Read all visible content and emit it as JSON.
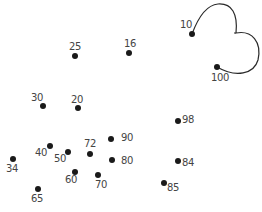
{
  "puzzle": {
    "type": "connect-the-dots",
    "drawn_path": {
      "from": "10",
      "to": "100",
      "description": "cloud-like outline drawn from dot 10 to dot 100",
      "stroke_color": "#2a2a2a"
    },
    "dots": [
      {
        "label": "10",
        "x": 192,
        "y": 34,
        "lx": 180,
        "ly": 20
      },
      {
        "label": "100",
        "x": 217,
        "y": 67,
        "lx": 211,
        "ly": 73
      },
      {
        "label": "25",
        "x": 75,
        "y": 56,
        "lx": 69,
        "ly": 42
      },
      {
        "label": "16",
        "x": 129,
        "y": 53,
        "lx": 124,
        "ly": 39
      },
      {
        "label": "30",
        "x": 43,
        "y": 106,
        "lx": 31,
        "ly": 93
      },
      {
        "label": "20",
        "x": 78,
        "y": 108,
        "lx": 71,
        "ly": 95
      },
      {
        "label": "98",
        "x": 178,
        "y": 121,
        "lx": 182,
        "ly": 115
      },
      {
        "label": "90",
        "x": 111,
        "y": 139,
        "lx": 121,
        "ly": 133
      },
      {
        "label": "72",
        "x": 90,
        "y": 154,
        "lx": 84,
        "ly": 139
      },
      {
        "label": "80",
        "x": 112,
        "y": 160,
        "lx": 121,
        "ly": 156
      },
      {
        "label": "40",
        "x": 50,
        "y": 146,
        "lx": 35,
        "ly": 148
      },
      {
        "label": "50",
        "x": 68,
        "y": 152,
        "lx": 54,
        "ly": 154
      },
      {
        "label": "34",
        "x": 13,
        "y": 159,
        "lx": 6,
        "ly": 164
      },
      {
        "label": "60",
        "x": 75,
        "y": 172,
        "lx": 65,
        "ly": 175
      },
      {
        "label": "70",
        "x": 98,
        "y": 175,
        "lx": 95,
        "ly": 180
      },
      {
        "label": "84",
        "x": 178,
        "y": 161,
        "lx": 182,
        "ly": 158
      },
      {
        "label": "85",
        "x": 164,
        "y": 183,
        "lx": 167,
        "ly": 183
      },
      {
        "label": "65",
        "x": 38,
        "y": 189,
        "lx": 31,
        "ly": 194
      }
    ]
  }
}
